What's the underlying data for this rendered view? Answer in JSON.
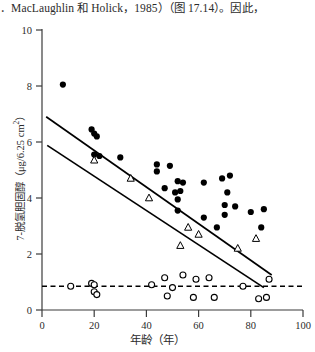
{
  "page": {
    "body_text": "．MacLaughlin 和 Holick，1985）（图 17.14）。因此，"
  },
  "figure": {
    "y_axis_title_main": "7-脱氢胆固醇（μg/6.25 cm",
    "y_axis_title_sup": "2",
    "y_axis_title_tail": "）",
    "x_axis_title": "年龄（年）"
  },
  "chart_data": {
    "type": "scatter",
    "title": "",
    "xlabel": "年龄（年）",
    "ylabel": "7-脱氢胆固醇（μg/6.25 cm2）",
    "xlim": [
      0,
      100
    ],
    "ylim": [
      0,
      10
    ],
    "xticks": [
      0,
      20,
      40,
      60,
      80,
      100
    ],
    "yticks": [
      0,
      2,
      4,
      6,
      8,
      10
    ],
    "grid": false,
    "legend": "none",
    "series": [
      {
        "name": "表皮（实心圆）",
        "marker": "filled-circle",
        "color": "#000000",
        "points": [
          [
            8,
            8.05
          ],
          [
            19,
            6.45
          ],
          [
            20,
            6.3
          ],
          [
            21,
            6.2
          ],
          [
            20,
            5.55
          ],
          [
            22,
            5.5
          ],
          [
            30,
            5.45
          ],
          [
            44,
            5.2
          ],
          [
            44,
            4.95
          ],
          [
            49,
            5.15
          ],
          [
            52,
            4.6
          ],
          [
            54,
            4.55
          ],
          [
            47,
            4.35
          ],
          [
            51,
            4.2
          ],
          [
            53,
            4.25
          ],
          [
            52,
            3.95
          ],
          [
            52,
            3.55
          ],
          [
            62,
            4.55
          ],
          [
            69,
            4.7
          ],
          [
            72,
            4.8
          ],
          [
            71,
            4.2
          ],
          [
            70,
            3.75
          ],
          [
            74,
            3.7
          ],
          [
            70,
            3.4
          ],
          [
            62,
            3.3
          ],
          [
            80,
            3.5
          ],
          [
            85,
            3.6
          ],
          [
            84,
            2.95
          ],
          [
            67,
            2.95
          ]
        ]
      },
      {
        "name": "真皮（空心三角）",
        "marker": "open-triangle",
        "color": "#000000",
        "points": [
          [
            20,
            5.35
          ],
          [
            34,
            4.7
          ],
          [
            41,
            4.0
          ],
          [
            56,
            2.95
          ],
          [
            60,
            2.7
          ],
          [
            53,
            2.3
          ],
          [
            75,
            2.2
          ],
          [
            82,
            2.55
          ]
        ]
      },
      {
        "name": "基线（空心圆）",
        "marker": "open-circle",
        "color": "#000000",
        "points": [
          [
            11,
            0.85
          ],
          [
            19,
            0.95
          ],
          [
            20,
            0.9
          ],
          [
            20,
            0.65
          ],
          [
            21,
            0.55
          ],
          [
            42,
            0.9
          ],
          [
            47,
            1.15
          ],
          [
            50,
            0.8
          ],
          [
            48,
            0.5
          ],
          [
            54,
            1.25
          ],
          [
            59,
            1.1
          ],
          [
            64,
            1.15
          ],
          [
            58,
            0.45
          ],
          [
            66,
            0.45
          ],
          [
            77,
            0.85
          ],
          [
            83,
            0.4
          ],
          [
            86,
            0.45
          ],
          [
            87,
            1.1
          ]
        ]
      }
    ],
    "lines": [
      {
        "name": "表皮回归线",
        "style": "solid",
        "x": [
          1.6,
          88.0
        ],
        "y": [
          6.9,
          1.25
        ]
      },
      {
        "name": "真皮回归线",
        "style": "solid",
        "x": [
          2.0,
          85.0
        ],
        "y": [
          5.88,
          0.8
        ]
      },
      {
        "name": "检出限基线",
        "style": "dashed",
        "x": [
          0.0,
          100.0
        ],
        "y": [
          0.85,
          0.85
        ]
      }
    ]
  }
}
